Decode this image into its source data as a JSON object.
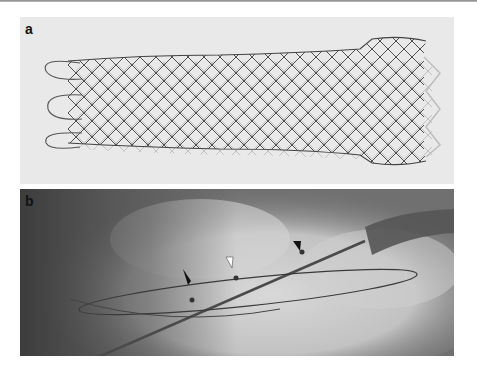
{
  "figure": {
    "panels": [
      {
        "label": "a",
        "content": "Photograph of a braided self-expanding metal stent with flared, looped ends"
      },
      {
        "label": "b",
        "content": "Fluoroscopic image of a stent delivery system with guidewire loop and endoscope",
        "annotations": [
          {
            "type": "black-arrow",
            "position": "left marker"
          },
          {
            "type": "white-arrowhead",
            "position": "middle marker"
          },
          {
            "type": "black-arrowhead",
            "position": "right marker"
          }
        ]
      }
    ]
  },
  "colors": {
    "panel_a_bg": "#e9e9e9",
    "panel_b_bg": "#6f6f6f",
    "stent_wire": "#3a3a3a",
    "label": "#111111"
  }
}
